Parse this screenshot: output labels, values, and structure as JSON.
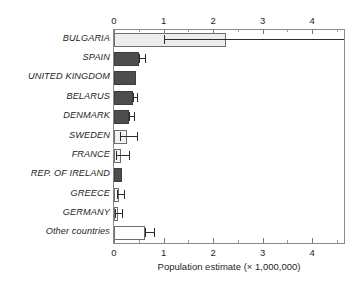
{
  "chart_data": {
    "type": "bar",
    "orientation": "horizontal",
    "title": "",
    "xlabel": "Population estimate (× 1,000,000)",
    "ylabel": "",
    "xlim": [
      0,
      4.64
    ],
    "xticks": [
      0,
      1,
      2,
      3,
      4
    ],
    "xticklabels": [
      "0",
      "1",
      "2",
      "3",
      "4"
    ],
    "minor_tick_step": 0.5,
    "grid": false,
    "legend": null,
    "axis_positions": [
      "top",
      "bottom"
    ],
    "categories": [
      "BULGARIA",
      "SPAIN",
      "UNITED KINGDOM",
      "BELARUS",
      "DENMARK",
      "SWEDEN",
      "FRANCE",
      "REP. OF IRELAND",
      "GREECE",
      "GERMANY",
      "Other countries"
    ],
    "values": [
      2.25,
      0.5,
      0.45,
      0.39,
      0.31,
      0.27,
      0.15,
      0.16,
      0.11,
      0.08,
      0.62
    ],
    "error_low": [
      1.0,
      0.5,
      0.45,
      0.39,
      0.31,
      0.12,
      0.04,
      0.16,
      0.06,
      0.03,
      0.62
    ],
    "error_high": [
      4.64,
      0.62,
      0.45,
      0.47,
      0.4,
      0.46,
      0.31,
      0.16,
      0.21,
      0.16,
      0.8
    ],
    "bar_fills": [
      "light",
      "dark",
      "dark",
      "dark",
      "dark",
      "pale",
      "pale",
      "dark",
      "white",
      "white",
      "white"
    ],
    "colors": {
      "bar_dark": "#4d4d4d",
      "bar_light": "#ededed",
      "bar_pale": "#f2f2f2",
      "bar_white": "#ffffff",
      "bar_edge": "#6e6e6e",
      "error_bar": "#2b2b2b",
      "axis": "#8a8a8a",
      "text": "#262626",
      "background": "#ffffff"
    }
  }
}
